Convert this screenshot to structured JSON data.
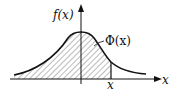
{
  "diagram": {
    "type": "normal-distribution-cdf-illustration",
    "labels": {
      "y_axis": "f(x)",
      "x_axis": "x",
      "x_marker": "x",
      "area": "Φ(x)"
    },
    "colors": {
      "stroke": "#111111",
      "hatch": "#555555",
      "background": "#ffffff"
    }
  }
}
